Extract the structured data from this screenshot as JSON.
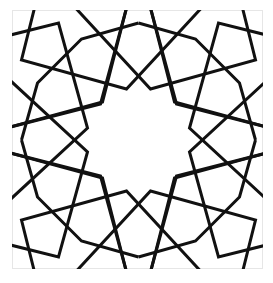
{
  "image": {
    "title": "Geometric star pattern",
    "description": "Islamic-style interlaced rosette with an eight-point central star, framed in a thin gray border"
  },
  "pattern": {
    "style": "interlaced rosette",
    "symmetry": "4-fold rotational with mirror symmetry (D4)",
    "central_star_points": 8,
    "line_color": "#111111",
    "background_color": "#ffffff",
    "frame_color": "#e6e6e6",
    "motifs": [
      "quadrilateral-corner-ribbons",
      "diagonal-crossing-ribbons",
      "outer-sixteen-sided-band",
      "central-eight-point-star"
    ]
  }
}
